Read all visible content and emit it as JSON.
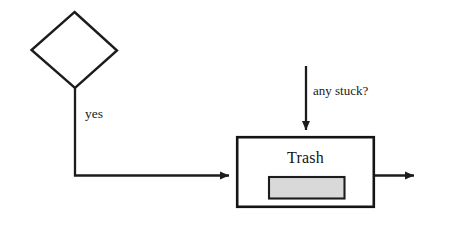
{
  "diagram": {
    "background_color": "#ffffff",
    "stroke_color": "#1c1c1c",
    "nodes": [
      {
        "id": "decision",
        "shape": "diamond",
        "label": "",
        "fill": "#ffffff",
        "stroke": "#1c1c1c",
        "x": 31,
        "y": 12,
        "width": 86,
        "height": 76
      },
      {
        "id": "trash",
        "shape": "rectangle",
        "label": "Trash",
        "fill": "#ffffff",
        "stroke": "#141414",
        "x": 236,
        "y": 136,
        "width": 139,
        "height": 72,
        "inner": {
          "id": "trash-queue-bar",
          "shape": "rectangle",
          "fill": "#d9d9d9",
          "stroke": "#1c1c1c",
          "x": 268,
          "y": 176,
          "width": 77,
          "height": 23
        }
      }
    ],
    "edges": [
      {
        "id": "decision-to-trash",
        "from": "decision",
        "to": "trash",
        "label": "yes",
        "arrowhead": true,
        "routing": "orthogonal"
      },
      {
        "id": "inflow-to-trash",
        "from": "",
        "to": "trash",
        "label": "any stuck?",
        "arrowhead": true,
        "routing": "vertical"
      },
      {
        "id": "trash-outflow",
        "from": "trash",
        "to": "",
        "label": "",
        "arrowhead": true,
        "routing": "horizontal"
      }
    ]
  }
}
